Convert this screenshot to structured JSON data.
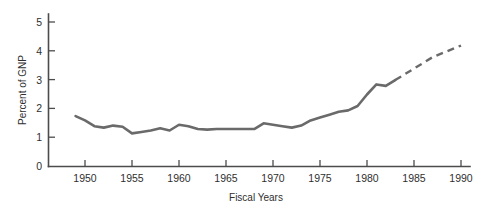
{
  "chart_data": {
    "type": "line",
    "title": "",
    "xlabel": "Fiscal Years",
    "ylabel": "Percent of GNP",
    "xlim": [
      1947,
      1992
    ],
    "ylim": [
      0,
      5.4
    ],
    "grid": false,
    "legend": "none",
    "xticks": [
      1950,
      1955,
      1960,
      1965,
      1970,
      1975,
      1980,
      1985,
      1990
    ],
    "xtick_labels": [
      "1950",
      "1955",
      "1960",
      "1965",
      "1970",
      "1975",
      "1980",
      "1985",
      "1990"
    ],
    "yticks": [
      0,
      1,
      2,
      3,
      4,
      5
    ],
    "ytick_labels": [
      "0",
      "1",
      "2",
      "3",
      "4",
      "5"
    ],
    "line_color": "#6a6a6a",
    "series": [
      {
        "name": "actual",
        "style": "solid",
        "x": [
          1949,
          1950,
          1951,
          1952,
          1953,
          1954,
          1955,
          1956,
          1957,
          1958,
          1959,
          1960,
          1961,
          1962,
          1963,
          1964,
          1965,
          1966,
          1967,
          1968,
          1969,
          1970,
          1971,
          1972,
          1973,
          1974,
          1975,
          1976,
          1977,
          1978,
          1979,
          1980,
          1981,
          1982,
          1983
        ],
        "y": [
          1.75,
          1.6,
          1.4,
          1.35,
          1.42,
          1.38,
          1.15,
          1.2,
          1.25,
          1.33,
          1.25,
          1.45,
          1.4,
          1.3,
          1.28,
          1.3,
          1.3,
          1.3,
          1.3,
          1.3,
          1.5,
          1.45,
          1.4,
          1.35,
          1.42,
          1.6,
          1.7,
          1.8,
          1.9,
          1.95,
          2.1,
          2.5,
          2.85,
          2.8,
          3.0
        ]
      },
      {
        "name": "projected",
        "style": "dashed",
        "x": [
          1983,
          1985,
          1987,
          1990
        ],
        "y": [
          3.0,
          3.4,
          3.8,
          4.2
        ]
      }
    ],
    "annotations": []
  },
  "axes": {
    "y_axis_title": "Percent of GNP",
    "x_axis_title": "Fiscal Years"
  }
}
